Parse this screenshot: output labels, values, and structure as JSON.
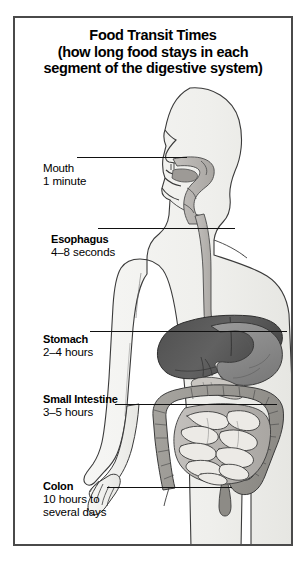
{
  "figure": {
    "title_lines": [
      "Food Transit Times",
      "(how long food stays in each",
      "segment of the digestive system)"
    ],
    "frame_color": "#4a4a4a",
    "background_color": "#ffffff",
    "text_color": "#000000",
    "leader_color": "#111111"
  },
  "labels": [
    {
      "name": "Mouth",
      "value": "1 minute",
      "value2": "",
      "bold_name": false
    },
    {
      "name": "Esophagus",
      "value": "4–8 seconds",
      "value2": "",
      "bold_name": true
    },
    {
      "name": "Stomach",
      "value": "2–4 hours",
      "value2": "",
      "bold_name": true
    },
    {
      "name": "Small Intestine",
      "value": "3–5 hours",
      "value2": "",
      "bold_name": true
    },
    {
      "name": "Colon",
      "value": "10 hours to",
      "value2": "several days",
      "bold_name": true
    }
  ],
  "anatomy": {
    "body_fill": "#f2f2f0",
    "body_outline": "#3a3a3a",
    "tract_fill": "#b8b5b2",
    "liver_fill": "#5c5c5c",
    "stomach_fill": "#8d8d8d",
    "intestine_fill": "#d8d6d2",
    "colon_fill": "#9a9894",
    "parts": [
      "head-profile",
      "neck",
      "torso",
      "arm",
      "hand",
      "legs",
      "oral-cavity",
      "esophagus",
      "stomach",
      "liver",
      "gallbladder",
      "pancreas",
      "small-intestine",
      "colon",
      "rectum"
    ]
  }
}
